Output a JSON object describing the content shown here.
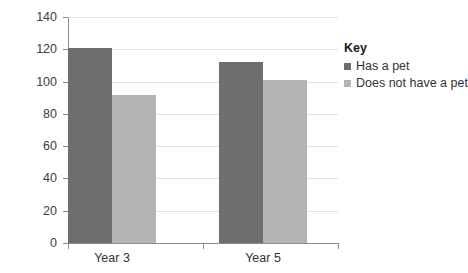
{
  "chart_data": {
    "type": "bar",
    "title": "",
    "xlabel": "",
    "ylabel": "",
    "categories": [
      "Year 3",
      "Year 5"
    ],
    "series": [
      {
        "name": "Has a pet",
        "color": "#6e6e6e",
        "values": [
          121,
          112
        ]
      },
      {
        "name": "Does not have a pet",
        "color": "#b4b4b4",
        "values": [
          92,
          101
        ]
      }
    ],
    "ylim": [
      0,
      140
    ],
    "ytick_step": 20,
    "yticks": [
      0,
      20,
      40,
      60,
      80,
      100,
      120,
      140
    ],
    "ytick_labels": [
      "0",
      "20",
      "40",
      "60",
      "80",
      "100",
      "120",
      "140"
    ],
    "grid": true,
    "legend_position": "right"
  },
  "legend": {
    "title": "Key",
    "entries": [
      {
        "label": "Has a pet"
      },
      {
        "label": "Does not have a pet"
      }
    ]
  },
  "colors": {
    "series_0": "#6e6e6e",
    "series_1": "#b4b4b4",
    "gridline": "#e2e2e2",
    "axis": "#8a8a8a",
    "text": "#333333",
    "background": "#ffffff"
  }
}
